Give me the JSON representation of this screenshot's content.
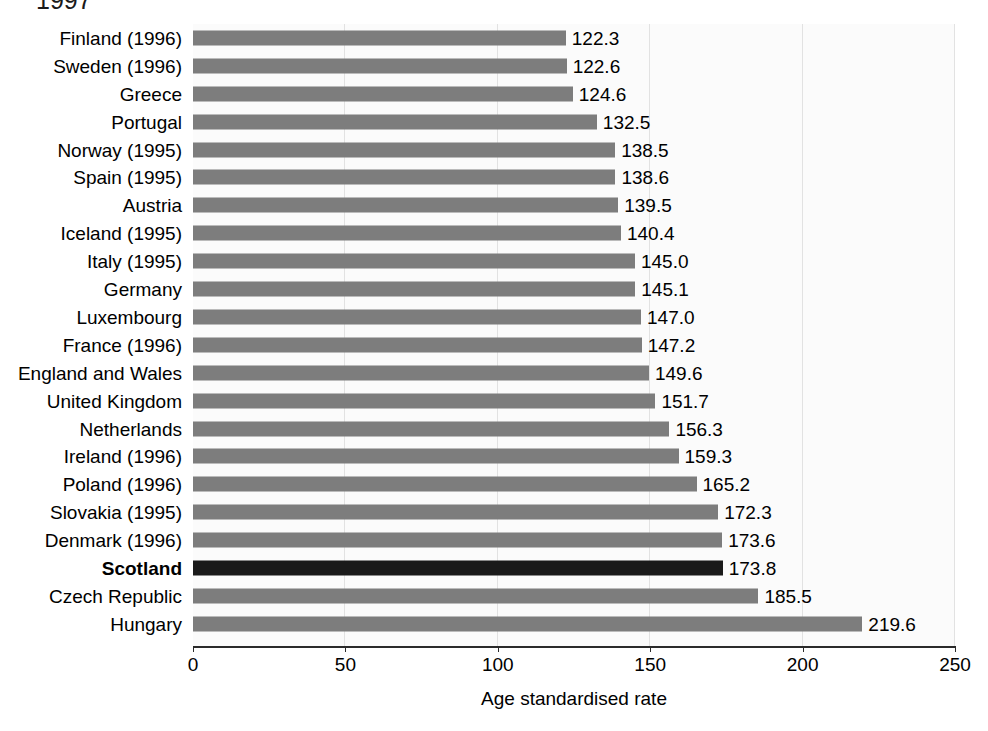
{
  "chart_title_partial": "1997",
  "axis": {
    "xlabel": "Age standardised rate",
    "ticks": [
      "0",
      "50",
      "100",
      "150",
      "200",
      "250"
    ]
  },
  "colors": {
    "bar": "#7d7d7d",
    "highlight_bar": "#1a1a1a",
    "plot_background": "#fbfbfb",
    "gridline": "#e2e2e2",
    "axis": "#2b2b2b"
  },
  "chart_data": {
    "type": "bar",
    "orientation": "horizontal",
    "title": "1997",
    "xlabel": "Age standardised rate",
    "ylabel": "",
    "xlim": [
      0,
      250
    ],
    "xticks": [
      0,
      50,
      100,
      150,
      200,
      250
    ],
    "grid": true,
    "legend": "none",
    "highlight_category": "Scotland",
    "categories": [
      "Finland (1996)",
      "Sweden (1996)",
      "Greece",
      "Portugal",
      "Norway (1995)",
      "Spain (1995)",
      "Austria",
      "Iceland (1995)",
      "Italy (1995)",
      "Germany",
      "Luxembourg",
      "France (1996)",
      "England and Wales",
      "United Kingdom",
      "Netherlands",
      "Ireland (1996)",
      "Poland (1996)",
      "Slovakia (1995)",
      "Denmark (1996)",
      "Scotland",
      "Czech Republic",
      "Hungary"
    ],
    "values": [
      122.3,
      122.6,
      124.6,
      132.5,
      138.5,
      138.6,
      139.5,
      140.4,
      145.0,
      145.1,
      147.0,
      147.2,
      149.6,
      151.7,
      156.3,
      159.3,
      165.2,
      172.3,
      173.6,
      173.8,
      185.5,
      219.6
    ],
    "value_labels": [
      "122.3",
      "122.6",
      "124.6",
      "132.5",
      "138.5",
      "138.6",
      "139.5",
      "140.4",
      "145.0",
      "145.1",
      "147.0",
      "147.2",
      "149.6",
      "151.7",
      "156.3",
      "159.3",
      "165.2",
      "172.3",
      "173.6",
      "173.8",
      "185.5",
      "219.6"
    ]
  }
}
